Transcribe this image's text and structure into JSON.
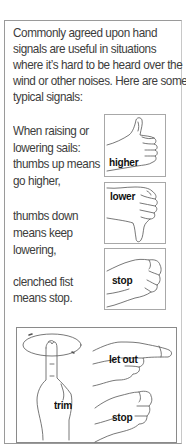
{
  "intro": {
    "lines": [
      "Commonly agreed upon hand",
      "signals are useful in situations",
      "where it’s hard to be heard over the",
      "wind or other noises. Here are some",
      "typical signals:"
    ]
  },
  "sails": {
    "raise_lines": [
      "When raising or",
      "lowering sails:",
      "thumbs up means",
      "go higher,"
    ],
    "lower_lines": [
      "thumbs down",
      "means keep",
      "lowering,"
    ],
    "stop_lines": [
      "clenched fist",
      "means stop."
    ]
  },
  "signal_images": [
    {
      "icon": "thumbs-up-hand-icon",
      "label": "higher"
    },
    {
      "icon": "thumbs-down-hand-icon",
      "label": "lower"
    },
    {
      "icon": "clenched-fist-icon",
      "label": "stop"
    }
  ],
  "trim_panel": {
    "labels": {
      "trim": "trim",
      "let_out": "let out",
      "stop": "stop"
    },
    "icons": [
      "circling-finger-hand-icon",
      "pointing-hand-icon",
      "clenched-fist-icon"
    ]
  }
}
